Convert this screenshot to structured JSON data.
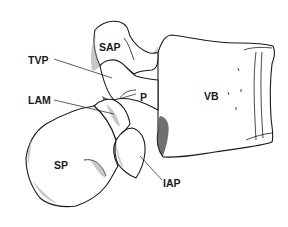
{
  "figure": {
    "labels": [
      {
        "id": "sap",
        "text": "SAP",
        "x": 99,
        "y": 51
      },
      {
        "id": "tvp",
        "text": "TVP",
        "x": 28,
        "y": 64
      },
      {
        "id": "lam",
        "text": "LAM",
        "x": 28,
        "y": 104
      },
      {
        "id": "p",
        "text": "P",
        "x": 140,
        "y": 101
      },
      {
        "id": "vb",
        "text": "VB",
        "x": 204,
        "y": 100
      },
      {
        "id": "sp",
        "text": "SP",
        "x": 54,
        "y": 169
      },
      {
        "id": "iap",
        "text": "IAP",
        "x": 163,
        "y": 187
      }
    ],
    "colors": {
      "ink": "#1a1a1a",
      "background": "#ffffff"
    }
  }
}
